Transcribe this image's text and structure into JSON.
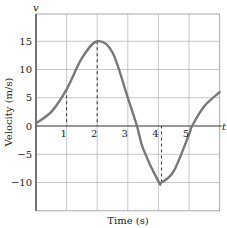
{
  "chart_data": {
    "type": "line",
    "title": "",
    "xlabel": "Time (s)",
    "ylabel": "Velocity (m/s)",
    "x_axis_variable": "t",
    "y_axis_variable": "v",
    "xlim": [
      0,
      6
    ],
    "ylim": [
      -15,
      20
    ],
    "x_ticks": [
      "1",
      "2",
      "3",
      "4",
      "5"
    ],
    "y_ticks": [
      "15",
      "10",
      "5",
      "0",
      "−5",
      "−10"
    ],
    "grid": true,
    "legend": "none",
    "series": [
      {
        "name": "velocity",
        "color": "#777777",
        "x": [
          0,
          0.5,
          1,
          1.5,
          2,
          2.5,
          3,
          3.3,
          3.5,
          4,
          4.1,
          4.5,
          5,
          5.1,
          5.5,
          6
        ],
        "y": [
          0.5,
          2.5,
          6.5,
          12,
          15,
          13,
          5,
          0,
          -4,
          -9.8,
          -10,
          -8,
          -1.5,
          0,
          3.5,
          6
        ]
      }
    ],
    "annotations": [
      {
        "type": "dashed-drop-line",
        "x": 1,
        "y": 6.5
      },
      {
        "type": "dashed-drop-line",
        "x": 2,
        "y": 15
      },
      {
        "type": "dashed-drop-line",
        "x": 4.1,
        "y": -10
      }
    ]
  }
}
